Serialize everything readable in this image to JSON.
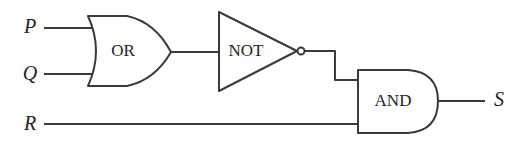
{
  "diagram": {
    "type": "logic-circuit",
    "inputs": [
      {
        "id": "P",
        "label": "P"
      },
      {
        "id": "Q",
        "label": "Q"
      },
      {
        "id": "R",
        "label": "R"
      }
    ],
    "output": {
      "id": "S",
      "label": "S"
    },
    "gates": [
      {
        "id": "or",
        "kind": "OR",
        "label": "OR",
        "inputs": [
          "P",
          "Q"
        ]
      },
      {
        "id": "not",
        "kind": "NOT",
        "label": "NOT",
        "inputs": [
          "or"
        ]
      },
      {
        "id": "and",
        "kind": "AND",
        "label": "AND",
        "inputs": [
          "not",
          "R"
        ],
        "output": "S"
      }
    ],
    "stroke_color": "#3a3a3a",
    "background": "#ffffff"
  }
}
